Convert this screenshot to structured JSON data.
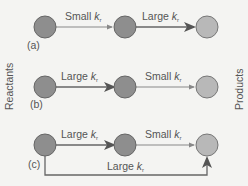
{
  "side_labels": {
    "left": "Reactants",
    "right": "Products"
  },
  "colors": {
    "reactant": "#8e8e8e",
    "intermediate": "#8e8e8e",
    "product": "#b8b8b8",
    "stroke": "#666666",
    "arrow": "#777777",
    "text": "#555555"
  },
  "panels": [
    {
      "id": "a",
      "label": "(a)",
      "step1": {
        "size": "Small",
        "k": "k",
        "sub": "r"
      },
      "step2": {
        "size": "Large",
        "k": "k",
        "sub": "r"
      }
    },
    {
      "id": "b",
      "label": "(b)",
      "step1": {
        "size": "Large",
        "k": "k",
        "sub": "r"
      },
      "step2": {
        "size": "Small",
        "k": "k",
        "sub": "r"
      }
    },
    {
      "id": "c",
      "label": "(c)",
      "step1": {
        "size": "Large",
        "k": "k",
        "sub": "r"
      },
      "step2": {
        "size": "Small",
        "k": "k",
        "sub": "r"
      },
      "bypass": {
        "size": "Large",
        "k": "k",
        "sub": "r"
      }
    }
  ]
}
